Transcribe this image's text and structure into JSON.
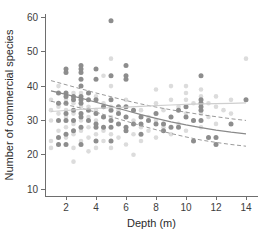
{
  "chart_data": {
    "type": "scatter",
    "title": "",
    "xlabel": "Depth (m)",
    "ylabel": "Number of commercial species",
    "xlim": [
      0.6,
      14.8
    ],
    "ylim": [
      8,
      61
    ],
    "xticks": [
      2,
      4,
      6,
      8,
      10,
      12,
      14
    ],
    "yticks": [
      10,
      20,
      30,
      40,
      50,
      60
    ],
    "grid": false,
    "legend": "none",
    "colors": {
      "points_dark": "#8d8d8d",
      "points_light": "#dcdcdc",
      "fit_solid": "#8a8a8a",
      "fit_dashed": "#9a9a9a",
      "fit_light": "#cfcfcf",
      "axis": "#6e6e6e",
      "text": "#2b2b2b",
      "background": "#ffffff"
    },
    "series": [
      {
        "name": "dark-points",
        "marker": "filled-circle",
        "color": "#8d8d8d",
        "points": [
          [
            1.5,
            23
          ],
          [
            1.5,
            25
          ],
          [
            1.5,
            30
          ],
          [
            1.5,
            35
          ],
          [
            1.5,
            38
          ],
          [
            2.0,
            23
          ],
          [
            2.0,
            26
          ],
          [
            2.0,
            30
          ],
          [
            2.0,
            32
          ],
          [
            2.0,
            35
          ],
          [
            2.0,
            37
          ],
          [
            2.0,
            38
          ],
          [
            2.0,
            44
          ],
          [
            2.0,
            45
          ],
          [
            2.5,
            27
          ],
          [
            2.5,
            30
          ],
          [
            2.5,
            33
          ],
          [
            2.5,
            36
          ],
          [
            2.5,
            37
          ],
          [
            3.0,
            23
          ],
          [
            3.0,
            28
          ],
          [
            3.0,
            31
          ],
          [
            3.0,
            32
          ],
          [
            3.0,
            35
          ],
          [
            3.0,
            36
          ],
          [
            3.0,
            37
          ],
          [
            3.0,
            40
          ],
          [
            3.0,
            42
          ],
          [
            3.0,
            44
          ],
          [
            3.0,
            45
          ],
          [
            3.0,
            46
          ],
          [
            3.5,
            30
          ],
          [
            3.5,
            33
          ],
          [
            3.5,
            36
          ],
          [
            3.5,
            38
          ],
          [
            4.0,
            24
          ],
          [
            4.0,
            28
          ],
          [
            4.0,
            29
          ],
          [
            4.0,
            32
          ],
          [
            4.0,
            36
          ],
          [
            4.0,
            42
          ],
          [
            4.0,
            45
          ],
          [
            4.5,
            28
          ],
          [
            4.5,
            31
          ],
          [
            4.5,
            34
          ],
          [
            5.0,
            24
          ],
          [
            5.0,
            28
          ],
          [
            5.0,
            30
          ],
          [
            5.0,
            33
          ],
          [
            5.0,
            36
          ],
          [
            5.0,
            43
          ],
          [
            5.0,
            59
          ],
          [
            5.5,
            29
          ],
          [
            5.5,
            32
          ],
          [
            5.5,
            34
          ],
          [
            6.0,
            27
          ],
          [
            6.0,
            28
          ],
          [
            6.0,
            31
          ],
          [
            6.0,
            34
          ],
          [
            6.0,
            42
          ],
          [
            6.0,
            43
          ],
          [
            6.0,
            46
          ],
          [
            6.5,
            29
          ],
          [
            6.5,
            33
          ],
          [
            7.0,
            26
          ],
          [
            7.0,
            29
          ],
          [
            7.0,
            31
          ],
          [
            7.5,
            30
          ],
          [
            8.0,
            29
          ],
          [
            8.0,
            32
          ],
          [
            8.5,
            27
          ],
          [
            8.5,
            29
          ],
          [
            9.0,
            28
          ],
          [
            9.0,
            31
          ],
          [
            9.5,
            28
          ],
          [
            9.5,
            33
          ],
          [
            10.0,
            31
          ],
          [
            10.0,
            34
          ],
          [
            10.5,
            24
          ],
          [
            10.5,
            30
          ],
          [
            11.0,
            30
          ],
          [
            11.0,
            33
          ],
          [
            11.0,
            34
          ],
          [
            11.0,
            35
          ],
          [
            11.0,
            36
          ],
          [
            11.0,
            43
          ],
          [
            11.5,
            25
          ],
          [
            12.0,
            23
          ],
          [
            12.0,
            25
          ],
          [
            13.0,
            29
          ],
          [
            14.0,
            36
          ]
        ]
      },
      {
        "name": "light-points",
        "marker": "filled-circle",
        "color": "#dcdcdc",
        "points": [
          [
            1.0,
            22
          ],
          [
            1.0,
            24
          ],
          [
            1.0,
            30
          ],
          [
            1.0,
            33
          ],
          [
            1.0,
            36
          ],
          [
            1.5,
            27
          ],
          [
            1.5,
            32
          ],
          [
            1.5,
            34
          ],
          [
            1.5,
            40
          ],
          [
            2.0,
            25
          ],
          [
            2.0,
            28
          ],
          [
            2.0,
            31
          ],
          [
            2.0,
            33
          ],
          [
            2.0,
            36
          ],
          [
            2.5,
            18
          ],
          [
            2.5,
            22
          ],
          [
            2.5,
            26
          ],
          [
            2.5,
            29
          ],
          [
            2.5,
            32
          ],
          [
            2.5,
            35
          ],
          [
            2.5,
            38
          ],
          [
            3.0,
            24
          ],
          [
            3.0,
            27
          ],
          [
            3.0,
            30
          ],
          [
            3.0,
            34
          ],
          [
            3.0,
            38
          ],
          [
            3.5,
            21
          ],
          [
            3.5,
            25
          ],
          [
            3.5,
            28
          ],
          [
            3.5,
            31
          ],
          [
            3.5,
            34
          ],
          [
            4.0,
            22
          ],
          [
            4.0,
            26
          ],
          [
            4.0,
            30
          ],
          [
            4.0,
            33
          ],
          [
            4.0,
            37
          ],
          [
            4.5,
            24
          ],
          [
            4.5,
            27
          ],
          [
            4.5,
            31
          ],
          [
            4.5,
            35
          ],
          [
            4.5,
            43
          ],
          [
            5.0,
            22
          ],
          [
            5.0,
            26
          ],
          [
            5.0,
            31
          ],
          [
            5.0,
            34
          ],
          [
            5.0,
            40
          ],
          [
            5.0,
            43
          ],
          [
            5.0,
            48
          ],
          [
            5.5,
            25
          ],
          [
            5.5,
            29
          ],
          [
            5.5,
            33
          ],
          [
            6.0,
            23
          ],
          [
            6.0,
            27
          ],
          [
            6.0,
            31
          ],
          [
            6.0,
            36
          ],
          [
            6.5,
            20
          ],
          [
            6.5,
            26
          ],
          [
            6.5,
            30
          ],
          [
            7.0,
            24
          ],
          [
            7.0,
            28
          ],
          [
            7.0,
            33
          ],
          [
            7.5,
            27
          ],
          [
            7.5,
            31
          ],
          [
            8.0,
            25
          ],
          [
            8.0,
            30
          ],
          [
            8.0,
            35
          ],
          [
            8.0,
            39
          ],
          [
            8.5,
            28
          ],
          [
            8.5,
            33
          ],
          [
            9.0,
            26
          ],
          [
            9.0,
            31
          ],
          [
            9.0,
            36
          ],
          [
            9.0,
            40
          ],
          [
            9.5,
            29
          ],
          [
            9.5,
            34
          ],
          [
            10.0,
            27
          ],
          [
            10.0,
            32
          ],
          [
            10.0,
            36
          ],
          [
            10.0,
            38
          ],
          [
            10.0,
            40
          ],
          [
            10.5,
            30
          ],
          [
            10.5,
            35
          ],
          [
            11.0,
            28
          ],
          [
            11.0,
            32
          ],
          [
            11.0,
            37
          ],
          [
            11.0,
            39
          ],
          [
            11.5,
            31
          ],
          [
            11.5,
            35
          ],
          [
            12.0,
            29
          ],
          [
            12.0,
            34
          ],
          [
            12.0,
            37
          ],
          [
            12.5,
            33
          ],
          [
            13.0,
            32
          ],
          [
            13.0,
            36
          ],
          [
            14.0,
            48
          ]
        ]
      }
    ],
    "fitted_lines": [
      {
        "name": "dark-fit-solid",
        "style": "solid",
        "color": "#8a8a8a",
        "points": [
          [
            1.0,
            38.6
          ],
          [
            2.0,
            37.6
          ],
          [
            3.0,
            36.5
          ],
          [
            4.0,
            35.3
          ],
          [
            5.0,
            34.1
          ],
          [
            6.0,
            32.9
          ],
          [
            7.0,
            31.7
          ],
          [
            8.0,
            30.6
          ],
          [
            9.0,
            29.6
          ],
          [
            10.0,
            28.7
          ],
          [
            11.0,
            27.9
          ],
          [
            12.0,
            27.2
          ],
          [
            13.0,
            26.6
          ],
          [
            14.0,
            26.1
          ]
        ]
      },
      {
        "name": "dark-fit-upper-ci",
        "style": "dashed",
        "color": "#9a9a9a",
        "points": [
          [
            1.0,
            41.6
          ],
          [
            2.0,
            40.4
          ],
          [
            3.0,
            39.2
          ],
          [
            4.0,
            38.0
          ],
          [
            5.0,
            36.9
          ],
          [
            6.0,
            35.8
          ],
          [
            7.0,
            34.8
          ],
          [
            8.0,
            33.9
          ],
          [
            9.0,
            33.1
          ],
          [
            10.0,
            32.4
          ],
          [
            11.0,
            31.7
          ],
          [
            12.0,
            31.1
          ],
          [
            13.0,
            30.5
          ],
          [
            14.0,
            30.0
          ]
        ]
      },
      {
        "name": "dark-fit-lower-ci",
        "style": "dashed",
        "color": "#9a9a9a",
        "points": [
          [
            1.0,
            35.6
          ],
          [
            2.0,
            34.6
          ],
          [
            3.0,
            33.6
          ],
          [
            4.0,
            32.4
          ],
          [
            5.0,
            31.1
          ],
          [
            6.0,
            29.8
          ],
          [
            7.0,
            28.5
          ],
          [
            8.0,
            27.3
          ],
          [
            9.0,
            26.2
          ],
          [
            10.0,
            25.2
          ],
          [
            11.0,
            24.3
          ],
          [
            12.0,
            23.6
          ],
          [
            13.0,
            23.0
          ],
          [
            14.0,
            22.5
          ]
        ]
      },
      {
        "name": "light-fit-solid",
        "style": "solid",
        "color": "#cfcfcf",
        "points": [
          [
            1.0,
            32.6
          ],
          [
            2.0,
            32.9
          ],
          [
            3.0,
            33.2
          ],
          [
            4.0,
            33.5
          ],
          [
            5.0,
            33.7
          ],
          [
            6.0,
            33.9
          ],
          [
            7.0,
            34.1
          ],
          [
            8.0,
            34.3
          ],
          [
            9.0,
            34.5
          ],
          [
            10.0,
            34.7
          ],
          [
            11.0,
            34.8
          ],
          [
            12.0,
            34.9
          ],
          [
            13.0,
            35.0
          ],
          [
            14.0,
            35.1
          ]
        ]
      }
    ]
  }
}
